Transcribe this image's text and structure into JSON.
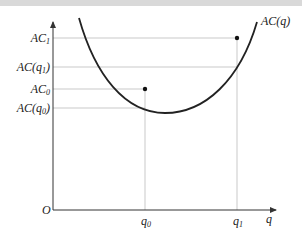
{
  "diagram": {
    "curve_label": "AC(q)",
    "origin_label": "O",
    "x_axis_label": "q",
    "x_ticks": [
      {
        "id": "q0",
        "label_main": "q",
        "label_sub": "0"
      },
      {
        "id": "q1",
        "label_main": "q",
        "label_sub": "1"
      }
    ],
    "y_ticks": [
      {
        "id": "AC1",
        "label_main": "AC",
        "label_sub": "1",
        "label_suffix": ""
      },
      {
        "id": "ACq1",
        "label_main": "AC(q",
        "label_sub": "1",
        "label_suffix": ")"
      },
      {
        "id": "AC0",
        "label_main": "AC",
        "label_sub": "0",
        "label_suffix": ""
      },
      {
        "id": "ACq0",
        "label_main": "AC(q",
        "label_sub": "0",
        "label_suffix": ")"
      }
    ],
    "points": [
      {
        "id": "point-q0-AC0",
        "x": "q0",
        "y": "AC0"
      },
      {
        "id": "point-q1-AC1",
        "x": "q1",
        "y": "AC1"
      }
    ],
    "colors": {
      "curve": "#222222",
      "axis": "#333333",
      "guide": "#bbbbbb",
      "point": "#111111"
    }
  }
}
